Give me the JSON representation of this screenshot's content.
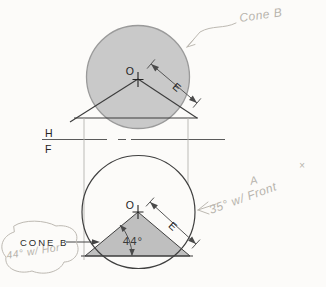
{
  "figure_title": "Descriptive geometry drawing of Cone B in top (H) and front (F) views",
  "fold_line": {
    "top_label": "H",
    "bottom_label": "F"
  },
  "top_view": {
    "center_label": "O",
    "element_label": "E"
  },
  "front_view": {
    "center_label": "O",
    "element_label": "E",
    "base_angle": "44°",
    "cone_callout": "CONE B"
  },
  "pencil_notes": {
    "cone_b": "Cone B",
    "a_letter": "A",
    "a_angle_note": "35° w/ Front",
    "cone_b_angle_note": "44° w/ Hor",
    "stray_mark": "×"
  },
  "colors": {
    "paper": "#fcfbf9",
    "print_dark": "#2e2e2e",
    "line_gray": "#5a5a5a",
    "projection_gray": "#b5b3af",
    "sphere_fill": "#c9c9c9",
    "cone_fill": "#bfbfbf",
    "pencil_gray": "#b7b3ac"
  }
}
